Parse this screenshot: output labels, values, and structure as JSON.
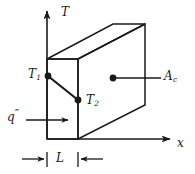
{
  "figure": {
    "name": "conduction-through-plane-wall",
    "stroke_color": "#1a1a1a",
    "background": "#ffffff",
    "axes": {
      "vertical": {
        "label": "T",
        "name": "temperature-axis"
      },
      "horizontal": {
        "label": "x",
        "name": "position-axis"
      }
    },
    "labels": {
      "t_axis": "T",
      "x_axis": "x",
      "t1": "T",
      "t1_sub": "1",
      "t2": "T",
      "t2_sub": "2",
      "area": "A",
      "area_sub": "c",
      "heat_flux": "q",
      "heat_flux_prime": "″",
      "thickness": "L"
    },
    "geometry": {
      "front_face": {
        "x1": 47,
        "y1": 59,
        "x2": 78,
        "y2": 139
      },
      "depth_offset": {
        "dx": 67,
        "dy": -35
      },
      "t1_point": {
        "x": 48,
        "y": 76
      },
      "t2_point": {
        "x": 78,
        "y": 100
      },
      "area_point": {
        "x": 113,
        "y": 78
      }
    }
  }
}
